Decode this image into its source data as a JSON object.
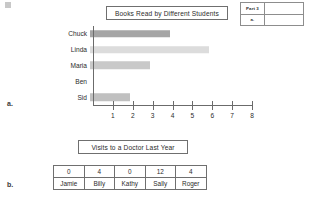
{
  "worksheet": {
    "part_box": {
      "part_label": "Part 3",
      "sub_label": "a."
    },
    "section_a_letter": "a.",
    "section_b_letter": "b."
  },
  "chart_data": [
    {
      "type": "bar",
      "orientation": "horizontal",
      "title": "Books Read by Different Students",
      "xlabel": "",
      "ylabel": "",
      "categories": [
        "Chuck",
        "Linda",
        "Maria",
        "Ben",
        "Sid"
      ],
      "values": [
        4,
        6,
        3,
        0,
        2
      ],
      "bar_colors": [
        "#a5a5a5",
        "#dcdcdc",
        "#c9c9c9",
        "#ffffff",
        "#c0c0c0"
      ],
      "xlim": [
        0,
        8
      ],
      "xticks": [
        "1",
        "2",
        "3",
        "4",
        "5",
        "6",
        "7",
        "8"
      ],
      "grid": false,
      "legend": "none"
    },
    {
      "type": "table",
      "title": "Visits to a Doctor Last Year",
      "rows": [
        [
          "0",
          "4",
          "0",
          "12",
          "4"
        ],
        [
          "Jamie",
          "Billy",
          "Kathy",
          "Sally",
          "Roger"
        ]
      ]
    }
  ]
}
